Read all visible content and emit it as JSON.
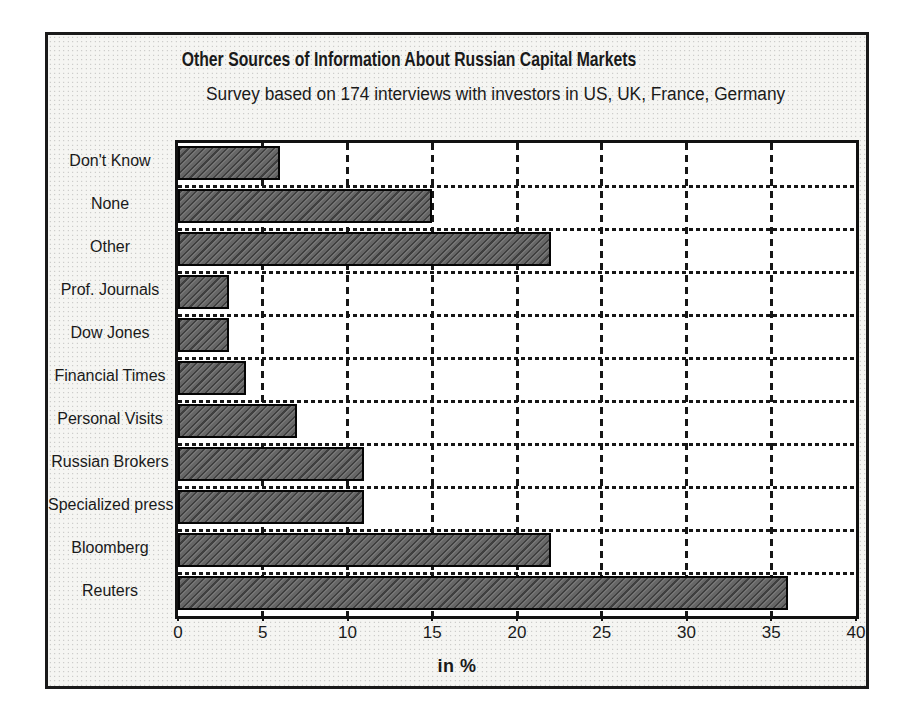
{
  "chart_data": {
    "type": "bar",
    "orientation": "horizontal",
    "title": "Other Sources of Information About Russian Capital Markets",
    "subtitle": "Survey based on 174 interviews with investors in US, UK, France, Germany",
    "categories": [
      "Don't Know",
      "None",
      "Other",
      "Prof. Journals",
      "Dow Jones",
      "Financial Times",
      "Personal Visits",
      "Russian Brokers",
      "Specialized press",
      "Bloomberg",
      "Reuters"
    ],
    "values": [
      6,
      15,
      22,
      3,
      3,
      4,
      7,
      11,
      11,
      22,
      36
    ],
    "xlabel": "in %",
    "xlim": [
      0,
      40
    ],
    "xticks": [
      0,
      5,
      10,
      15,
      20,
      25,
      30,
      35,
      40
    ],
    "grid": "dashed vertical gridlines at each tick, dashed horizontal separators between category rows",
    "legend": "none",
    "bar_color": "#666666",
    "bar_hatch": "diagonal",
    "bar_border_color": "#050505",
    "plot_background": "#ffffff",
    "figure_background": "#f5f5f2",
    "gridline_color": "#161616",
    "text_color": "#1a1a1a"
  }
}
